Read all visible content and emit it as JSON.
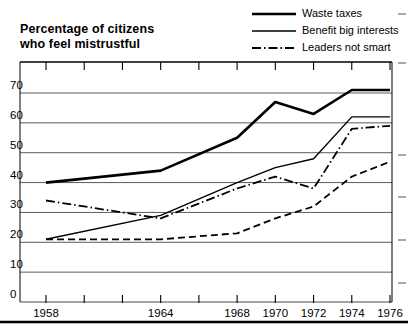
{
  "chart_data": {
    "type": "line",
    "title": "Percentage of citizens who feel mistrustful",
    "title_line1": "Percentage of citizens",
    "title_line2": "who feel mistrustful",
    "xlabel": "",
    "ylabel": "",
    "x": [
      1958,
      1960,
      1962,
      1964,
      1966,
      1968,
      1970,
      1972,
      1974,
      1976
    ],
    "xtick_labels": [
      "1958",
      "",
      "",
      "1964",
      "",
      "1968",
      "1970",
      "1972",
      "1974",
      "1976"
    ],
    "xtick_values": [
      1958,
      1960,
      1962,
      1964,
      1966,
      1968,
      1970,
      1972,
      1974,
      1976
    ],
    "ytick_labels": [
      "0",
      "10",
      "20",
      "30",
      "40",
      "50",
      "60",
      "70"
    ],
    "ytick_values": [
      0,
      10,
      20,
      30,
      40,
      50,
      60,
      70
    ],
    "ylim": [
      0,
      75
    ],
    "xlim": [
      1957,
      1977
    ],
    "grid": true,
    "grid_axis": "y",
    "legend_position": "top-right",
    "series": [
      {
        "name": "Waste taxes",
        "style": "solid-thick",
        "color": "#000000",
        "x": [
          1958,
          1964,
          1968,
          1970,
          1972,
          1974,
          1976
        ],
        "values": [
          40,
          44,
          55,
          67,
          63,
          71,
          71
        ]
      },
      {
        "name": "Benefit big interests",
        "style": "solid-thin",
        "color": "#000000",
        "x": [
          1958,
          1964,
          1968,
          1970,
          1972,
          1974,
          1976
        ],
        "values": [
          21,
          29,
          40,
          45,
          48,
          62,
          62
        ]
      },
      {
        "name": "Leaders not smart",
        "style": "dash-dot",
        "color": "#000000",
        "x": [
          1958,
          1964,
          1968,
          1970,
          1972,
          1974,
          1976
        ],
        "values": [
          34,
          28,
          38,
          42,
          38,
          58,
          59
        ]
      },
      {
        "name": "Leaders not smart (lower)",
        "style": "dashed",
        "color": "#000000",
        "x": [
          1958,
          1964,
          1968,
          1970,
          1972,
          1974,
          1976
        ],
        "values": [
          21,
          21,
          23,
          28,
          32,
          42,
          47
        ]
      }
    ]
  },
  "legend": {
    "items": [
      {
        "label": "Waste taxes",
        "style": "solid-thick"
      },
      {
        "label": "Benefit big interests",
        "style": "solid-thin"
      },
      {
        "label": "Leaders not smart",
        "style": "dash-dot"
      }
    ]
  }
}
